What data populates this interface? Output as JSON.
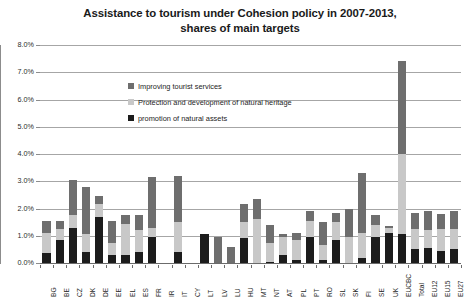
{
  "chart_data": {
    "type": "bar",
    "stacked": true,
    "title": "Assistance to tourism under Cohesion policy in 2007-2013, shares of main targets",
    "title_lines": [
      "Assistance to tourism under Cohesion policy in 2007-2013,",
      "shares of main targets"
    ],
    "xlabel": "",
    "ylabel": "",
    "ylim": [
      0,
      0.08
    ],
    "ytick_labels": [
      "0.0%",
      "1.0%",
      "2.0%",
      "3.0%",
      "4.0%",
      "5.0%",
      "6.0%",
      "7.0%",
      "8.0%"
    ],
    "ytick_values": [
      0.0,
      0.01,
      0.02,
      0.03,
      0.04,
      0.05,
      0.06,
      0.07,
      0.08
    ],
    "grid": true,
    "legend_position": "inside-top-left",
    "categories": [
      "BG",
      "BE",
      "CZ",
      "DK",
      "DE",
      "EE",
      "EL",
      "ES",
      "FR",
      "IR",
      "IT",
      "CY",
      "LT",
      "LV",
      "LU",
      "HU",
      "MT",
      "NT",
      "AT",
      "PL",
      "PT",
      "RO",
      "SL",
      "SK",
      "FI",
      "SE",
      "UK",
      "EUCBC",
      "Total",
      "EU12",
      "EU15",
      "EU27"
    ],
    "series": [
      {
        "name": "promotion of natural assets",
        "color": "#1c1c1c",
        "values": [
          0.0035,
          0.0085,
          0.013,
          0.004,
          0.017,
          0.003,
          0.003,
          0.004,
          0.0095,
          0.0,
          0.004,
          0.0,
          0.0105,
          0.0,
          0.0,
          0.009,
          0.0,
          0.0005,
          0.003,
          0.001,
          0.0095,
          0.001,
          0.0085,
          0.0,
          0.002,
          0.0095,
          0.011,
          0.0105,
          0.005,
          0.0055,
          0.0045,
          0.005
        ]
      },
      {
        "name": "Protection and development of natural heritage",
        "color": "#c8c8c8",
        "values": [
          0.0075,
          0.004,
          0.0045,
          0.0065,
          0.0045,
          0.0045,
          0.0115,
          0.008,
          0.0035,
          0.0,
          0.011,
          0.0,
          0.0,
          0.0,
          0.0,
          0.006,
          0.016,
          0.007,
          0.0065,
          0.0075,
          0.006,
          0.0055,
          0.0065,
          0.0095,
          0.009,
          0.0045,
          0.002,
          0.0295,
          0.0075,
          0.0065,
          0.008,
          0.0075
        ]
      },
      {
        "name": "Improving tourist services",
        "color": "#6e6e6e",
        "values": [
          0.0045,
          0.003,
          0.013,
          0.0175,
          0.003,
          0.008,
          0.003,
          0.0055,
          0.0185,
          0.0,
          0.017,
          0.0,
          0.0,
          0.0095,
          0.006,
          0.0065,
          0.0075,
          0.0065,
          0.001,
          0.0025,
          0.0035,
          0.0085,
          0.0035,
          0.0105,
          0.022,
          0.0035,
          0.0005,
          0.034,
          0.006,
          0.007,
          0.0055,
          0.0065
        ]
      }
    ]
  },
  "legend": {
    "items": [
      {
        "label": "Improving tourist services",
        "swatch_class": "sw-improving"
      },
      {
        "label": "Protection and development of natural heritage",
        "swatch_class": "sw-protection"
      },
      {
        "label": "promotion of natural assets",
        "swatch_class": "sw-promotion"
      }
    ]
  }
}
